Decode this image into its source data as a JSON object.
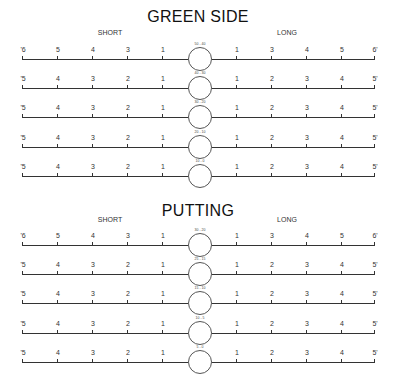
{
  "sections": [
    {
      "title": "GREEN SIDE",
      "short_label": "SHORT",
      "long_label": "LONG",
      "rows": [
        {
          "circle_label": "50 - 40",
          "left_ticks": [
            "'6",
            "5",
            "4",
            "3",
            "1"
          ],
          "right_ticks": [
            "1",
            "3",
            "4",
            "5",
            "6'"
          ]
        },
        {
          "circle_label": "40 - 30",
          "left_ticks": [
            "'5",
            "4",
            "3",
            "2",
            "1"
          ],
          "right_ticks": [
            "1",
            "2",
            "3",
            "4",
            "5'"
          ]
        },
        {
          "circle_label": "30 - 20",
          "left_ticks": [
            "'5",
            "4",
            "3",
            "2",
            "1"
          ],
          "right_ticks": [
            "1",
            "2",
            "3",
            "4",
            "5'"
          ]
        },
        {
          "circle_label": "20 - 10",
          "left_ticks": [
            "'5",
            "4",
            "3",
            "2",
            "1"
          ],
          "right_ticks": [
            "1",
            "2",
            "3",
            "4",
            "5'"
          ]
        },
        {
          "circle_label": "10 - 0",
          "left_ticks": [
            "'5",
            "4",
            "3",
            "2",
            "1"
          ],
          "right_ticks": [
            "1",
            "2",
            "3",
            "4",
            "5'"
          ]
        }
      ]
    },
    {
      "title": "PUTTING",
      "short_label": "SHORT",
      "long_label": "LONG",
      "rows": [
        {
          "circle_label": "30 - 20",
          "left_ticks": [
            "'6",
            "5",
            "4",
            "3",
            "1"
          ],
          "right_ticks": [
            "1",
            "3",
            "4",
            "5",
            "6'"
          ]
        },
        {
          "circle_label": "25 - 15",
          "left_ticks": [
            "'5",
            "4",
            "3",
            "2",
            "1"
          ],
          "right_ticks": [
            "1",
            "2",
            "3",
            "4",
            "5'"
          ]
        },
        {
          "circle_label": "15 - 10",
          "left_ticks": [
            "'5",
            "4",
            "3",
            "2",
            "1"
          ],
          "right_ticks": [
            "1",
            "2",
            "3",
            "4",
            "5'"
          ]
        },
        {
          "circle_label": "10 - 5",
          "left_ticks": [
            "'5",
            "4",
            "3",
            "2",
            "1"
          ],
          "right_ticks": [
            "1",
            "2",
            "3",
            "4",
            "5'"
          ]
        },
        {
          "circle_label": "5 - 0",
          "left_ticks": [
            "'5",
            "4",
            "3",
            "2",
            "1"
          ],
          "right_ticks": [
            "1",
            "2",
            "3",
            "4",
            "5'"
          ]
        }
      ]
    }
  ]
}
